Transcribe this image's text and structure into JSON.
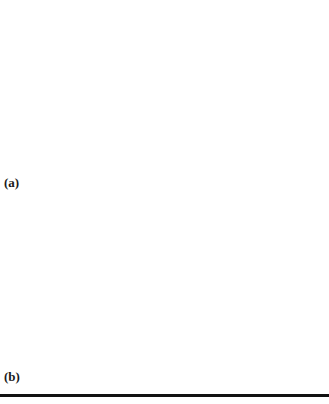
{
  "chart_data": [
    {
      "type": "line",
      "panel_label": "(a)",
      "title": "",
      "xlabel": "",
      "ylabel": "",
      "grid": false,
      "legend": null,
      "frame_px": {
        "x0": 34,
        "y0": 21,
        "x1": 310,
        "y1": 188
      },
      "x_ticks_px": [
        62,
        88,
        117,
        145,
        173,
        200,
        228,
        256,
        284
      ],
      "y_ticks_px": [
        38,
        56,
        72,
        88,
        104,
        121,
        138,
        155,
        171
      ],
      "points": {
        "A": [
          34,
          104
        ],
        "B": [
          38,
          82
        ],
        "C": [
          97,
          34
        ],
        "D": [
          133,
          24
        ],
        "E": [
          173,
          21
        ],
        "F": [
          230,
          28
        ],
        "G": [
          262,
          40
        ],
        "H": [
          288,
          57
        ],
        "I": [
          308,
          113
        ],
        "J": [
          297,
          137
        ],
        "K": [
          229,
          178
        ],
        "L": [
          101,
          173
        ],
        "M": [
          68,
          158
        ]
      },
      "segments": [
        [
          "M",
          "J"
        ],
        [
          "M",
          "B"
        ],
        [
          "B",
          "C"
        ],
        [
          "C",
          "F"
        ],
        [
          "F",
          "A"
        ],
        [
          "A",
          "K"
        ],
        [
          "K",
          "G"
        ],
        [
          "G",
          "M"
        ],
        [
          "M",
          "E"
        ],
        [
          "E",
          "H"
        ],
        [
          "E",
          "J"
        ],
        [
          "D",
          "A"
        ],
        [
          "D",
          "M"
        ],
        [
          "D",
          "G"
        ],
        [
          "D",
          "I"
        ],
        [
          "G",
          "I"
        ],
        [
          "I",
          "L"
        ],
        [
          "L",
          "K"
        ],
        [
          "K",
          "I"
        ],
        [
          "E",
          "D"
        ]
      ],
      "line_color": "#7a7a7a"
    },
    {
      "type": "line",
      "panel_label": "(b)",
      "title": "",
      "xlabel": "",
      "ylabel": "",
      "grid": false,
      "legend": null,
      "frame_px": {
        "x0": 35,
        "y0": 208,
        "x1": 312,
        "y1": 382
      },
      "x_ticks_px": [
        67,
        97,
        128,
        158,
        190,
        221,
        251,
        282
      ],
      "y_ticks_px": [
        227,
        244,
        260,
        277,
        295,
        313,
        331,
        349,
        366
      ],
      "points": {
        "P1": [
          42,
          260
        ],
        "P2": [
          289,
          212
        ],
        "P3": [
          35,
          287
        ],
        "P4": [
          105,
          364
        ]
      },
      "segments": [
        [
          "P1",
          "P2"
        ],
        [
          "P2",
          "P3"
        ],
        [
          "P3",
          "P4"
        ]
      ],
      "line_color": "#7a7a7a"
    }
  ],
  "labels": {
    "panel_a": "(a)",
    "panel_b": "(b)"
  }
}
